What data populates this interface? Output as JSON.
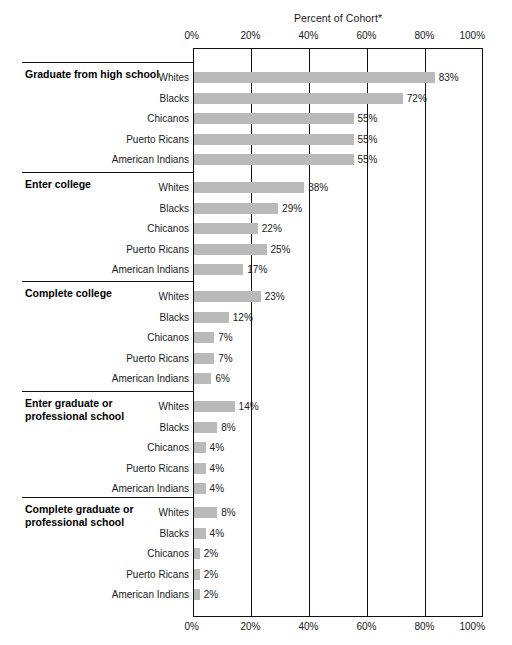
{
  "chart_data": {
    "type": "bar",
    "title": "Percent of Cohort*",
    "xlabel": "",
    "ylabel": "",
    "xlim": [
      0,
      100
    ],
    "grid": true,
    "orientation": "horizontal",
    "legend_position": "none",
    "tick_labels": [
      "0%",
      "20%",
      "40%",
      "60%",
      "80%",
      "100%"
    ],
    "tick_values": [
      0,
      20,
      40,
      60,
      80,
      100
    ],
    "categories": [
      "Whites",
      "Blacks",
      "Chicanos",
      "Puerto Ricans",
      "American Indians"
    ],
    "groups": [
      {
        "label": "Graduate from high school",
        "values": [
          83,
          72,
          55,
          55,
          55
        ],
        "value_labels": [
          "83%",
          "72%",
          "55%",
          "55%",
          "55%"
        ]
      },
      {
        "label": "Enter college",
        "values": [
          38,
          29,
          22,
          25,
          17
        ],
        "value_labels": [
          "38%",
          "29%",
          "22%",
          "25%",
          "17%"
        ]
      },
      {
        "label": "Complete college",
        "values": [
          23,
          12,
          7,
          7,
          6
        ],
        "value_labels": [
          "23%",
          "12%",
          "7%",
          "7%",
          "6%"
        ]
      },
      {
        "label": "Enter graduate or professional school",
        "values": [
          14,
          8,
          4,
          4,
          4
        ],
        "value_labels": [
          "14%",
          "8%",
          "4%",
          "4%",
          "4%"
        ]
      },
      {
        "label": "Complete graduate or professional school",
        "values": [
          8,
          4,
          2,
          2,
          2
        ],
        "value_labels": [
          "8%",
          "4%",
          "2%",
          "2%",
          "2%"
        ]
      }
    ]
  },
  "colors": {
    "bar_fill": "#bababa",
    "axis": "#111111",
    "text": "#1a1a1a",
    "background": "#ffffff"
  }
}
